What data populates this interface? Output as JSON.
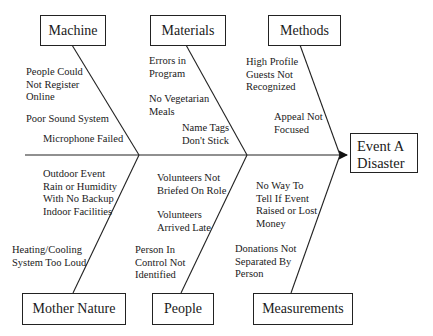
{
  "diagram": {
    "type": "fishbone",
    "effect": {
      "label": "Event A\nDisaster"
    },
    "categories": [
      {
        "name": "Machine",
        "position": "top",
        "causes": [
          "People Could\nNot Register\nOnline",
          "Poor Sound System",
          "Microphone Failed"
        ]
      },
      {
        "name": "Materials",
        "position": "top",
        "causes": [
          "Errors in\nProgram",
          "No Vegetarian\nMeals",
          "Name Tags\nDon't Stick"
        ]
      },
      {
        "name": "Methods",
        "position": "top",
        "causes": [
          "High Profile\nGuests Not\nRecognized",
          "Appeal Not\nFocused"
        ]
      },
      {
        "name": "Mother Nature",
        "position": "bottom",
        "causes": [
          "Outdoor Event\nRain or Humidity\nWith No Backup\nIndoor Facilities",
          "Heating/Cooling\nSystem Too Loud"
        ]
      },
      {
        "name": "People",
        "position": "bottom",
        "causes": [
          "Volunteers Not\nBriefed On Role",
          "Volunteers\nArrived Late",
          "Person In\nControl Not\nIdentified"
        ]
      },
      {
        "name": "Measurements",
        "position": "bottom",
        "causes": [
          "No Way To\nTell If Event\nRaised or Lost\nMoney",
          "Donations Not\nSeparated By\nPerson"
        ]
      }
    ]
  }
}
